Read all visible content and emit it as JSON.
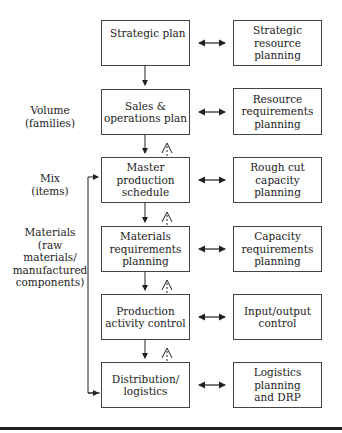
{
  "diagram": {
    "left_boxes": [
      {
        "id": "strategic-plan",
        "label": "Strategic plan"
      },
      {
        "id": "sales-operations-plan",
        "label": "Sales &\noperations plan"
      },
      {
        "id": "master-production-schedule",
        "label": "Master\nproduction\nschedule"
      },
      {
        "id": "materials-requirements-planning",
        "label": "Materials\nrequirements\nplanning"
      },
      {
        "id": "production-activity-control",
        "label": "Production\nactivity control"
      },
      {
        "id": "distribution-logistics",
        "label": "Distribution/\nlogistics"
      }
    ],
    "right_boxes": [
      {
        "id": "strategic-resource-planning",
        "label": "Strategic\nresource\nplanning"
      },
      {
        "id": "resource-requirements-planning",
        "label": "Resource\nrequirements\nplanning"
      },
      {
        "id": "rough-cut-capacity-planning",
        "label": "Rough cut\ncapacity\nplanning"
      },
      {
        "id": "capacity-requirements-planning",
        "label": "Capacity\nrequirements\nplanning"
      },
      {
        "id": "input-output-control",
        "label": "Input/output\ncontrol"
      },
      {
        "id": "logistics-planning-drp",
        "label": "Logistics\nplanning\nand DRP"
      }
    ],
    "side_labels": {
      "volume": "Volume\n(families)",
      "mix": "Mix\n(items)",
      "materials": "Materials\n(raw materials/\nmanufactured\ncomponents)"
    }
  }
}
